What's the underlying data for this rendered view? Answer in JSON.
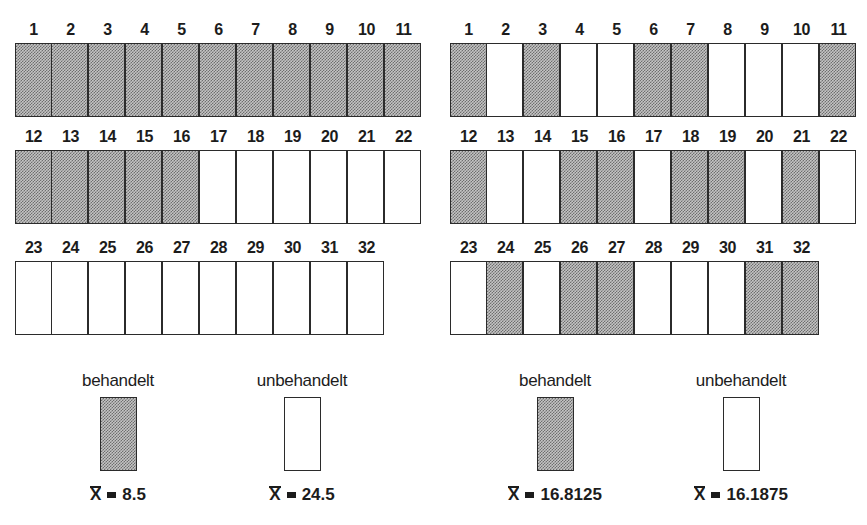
{
  "chart_data": {
    "type": "diagram",
    "title": "",
    "panels": [
      {
        "name": "left",
        "layout": "systematic",
        "cells": 32,
        "treated_cells": [
          1,
          2,
          3,
          4,
          5,
          6,
          7,
          8,
          9,
          10,
          11,
          12,
          13,
          14,
          15,
          16
        ],
        "untreated_cells": [
          17,
          18,
          19,
          20,
          21,
          22,
          23,
          24,
          25,
          26,
          27,
          28,
          29,
          30,
          31,
          32
        ],
        "mean_treated": 8.5,
        "mean_untreated": 24.5
      },
      {
        "name": "right",
        "layout": "randomized",
        "cells": 32,
        "treated_cells": [
          1,
          3,
          6,
          7,
          11,
          12,
          15,
          16,
          18,
          19,
          21,
          24,
          26,
          27,
          31,
          32
        ],
        "untreated_cells": [
          2,
          4,
          5,
          8,
          9,
          10,
          13,
          14,
          17,
          20,
          22,
          23,
          25,
          28,
          29,
          30
        ],
        "mean_treated": 16.8125,
        "mean_untreated": 16.1875
      }
    ],
    "legend": [
      "behandelt",
      "unbehandelt"
    ]
  },
  "legend": {
    "treated_label": "behandelt",
    "untreated_label": "unbehandelt",
    "mean_symbol": "X"
  },
  "colors": {
    "treated_fill": "#c4c4c4",
    "treated_dots": "#6e6e6e",
    "untreated_fill": "#ffffff",
    "border": "#2b2b2b"
  },
  "left": {
    "rows": [
      [
        {
          "n": "1",
          "t": true
        },
        {
          "n": "2",
          "t": true
        },
        {
          "n": "3",
          "t": true
        },
        {
          "n": "4",
          "t": true
        },
        {
          "n": "5",
          "t": true
        },
        {
          "n": "6",
          "t": true
        },
        {
          "n": "7",
          "t": true
        },
        {
          "n": "8",
          "t": true
        },
        {
          "n": "9",
          "t": true
        },
        {
          "n": "10",
          "t": true
        },
        {
          "n": "11",
          "t": true
        }
      ],
      [
        {
          "n": "12",
          "t": true
        },
        {
          "n": "13",
          "t": true
        },
        {
          "n": "14",
          "t": true
        },
        {
          "n": "15",
          "t": true
        },
        {
          "n": "16",
          "t": true
        },
        {
          "n": "17",
          "t": false
        },
        {
          "n": "18",
          "t": false
        },
        {
          "n": "19",
          "t": false
        },
        {
          "n": "20",
          "t": false
        },
        {
          "n": "21",
          "t": false
        },
        {
          "n": "22",
          "t": false
        }
      ],
      [
        {
          "n": "23",
          "t": false
        },
        {
          "n": "24",
          "t": false
        },
        {
          "n": "25",
          "t": false
        },
        {
          "n": "26",
          "t": false
        },
        {
          "n": "27",
          "t": false
        },
        {
          "n": "28",
          "t": false
        },
        {
          "n": "29",
          "t": false
        },
        {
          "n": "30",
          "t": false
        },
        {
          "n": "31",
          "t": false
        },
        {
          "n": "32",
          "t": false
        }
      ]
    ],
    "mean_treated": "8.5",
    "mean_untreated": "24.5"
  },
  "right": {
    "rows": [
      [
        {
          "n": "1",
          "t": true
        },
        {
          "n": "2",
          "t": false
        },
        {
          "n": "3",
          "t": true
        },
        {
          "n": "4",
          "t": false
        },
        {
          "n": "5",
          "t": false
        },
        {
          "n": "6",
          "t": true
        },
        {
          "n": "7",
          "t": true
        },
        {
          "n": "8",
          "t": false
        },
        {
          "n": "9",
          "t": false
        },
        {
          "n": "10",
          "t": false
        },
        {
          "n": "11",
          "t": true
        }
      ],
      [
        {
          "n": "12",
          "t": true
        },
        {
          "n": "13",
          "t": false
        },
        {
          "n": "14",
          "t": false
        },
        {
          "n": "15",
          "t": true
        },
        {
          "n": "16",
          "t": true
        },
        {
          "n": "17",
          "t": false
        },
        {
          "n": "18",
          "t": true
        },
        {
          "n": "19",
          "t": true
        },
        {
          "n": "20",
          "t": false
        },
        {
          "n": "21",
          "t": true
        },
        {
          "n": "22",
          "t": false
        }
      ],
      [
        {
          "n": "23",
          "t": false
        },
        {
          "n": "24",
          "t": true
        },
        {
          "n": "25",
          "t": false
        },
        {
          "n": "26",
          "t": true
        },
        {
          "n": "27",
          "t": true
        },
        {
          "n": "28",
          "t": false
        },
        {
          "n": "29",
          "t": false
        },
        {
          "n": "30",
          "t": false
        },
        {
          "n": "31",
          "t": true
        },
        {
          "n": "32",
          "t": true
        }
      ]
    ],
    "mean_treated": "16.8125",
    "mean_untreated": "16.1875"
  }
}
